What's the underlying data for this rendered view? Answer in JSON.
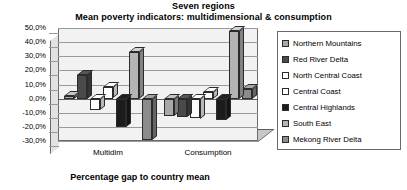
{
  "chart": {
    "title_line1": "Seven regions",
    "title_line2": "Mean poverty indicators: multidimensional & consumption",
    "axis_title": "Percentage gap to country mean"
  },
  "chart_data": {
    "type": "bar",
    "subtitle": "Mean poverty indicators: multidimensional & consumption",
    "xlabel": "Percentage gap to country mean",
    "ylabel": "",
    "categories": [
      "Multidim",
      "Consumption"
    ],
    "ylim": [
      -30,
      50
    ],
    "ytick_labels": [
      "50,0%",
      "40,0%",
      "30,0%",
      "20,0%",
      "10,0%",
      "0,0%",
      "-10,0%",
      "-20,0%",
      "-30,0%"
    ],
    "ytick_values": [
      50,
      40,
      30,
      20,
      10,
      0,
      -10,
      -20,
      -30
    ],
    "grid": true,
    "legend_position": "right",
    "three_d": true,
    "series": [
      {
        "name": "Northern Mountains",
        "color": "#a8a8a8",
        "values": [
          2,
          -12
        ]
      },
      {
        "name": "Red River Delta",
        "color": "#4a4a4a",
        "values": [
          17,
          -13
        ]
      },
      {
        "name": "North Central Coast",
        "color": "#ffffff",
        "values": [
          -8,
          -14
        ]
      },
      {
        "name": "Central Coast",
        "color": "#ffffff",
        "values": [
          8,
          5
        ]
      },
      {
        "name": "Central Highlands",
        "color": "#1c1c1c",
        "values": [
          -20,
          -15
        ]
      },
      {
        "name": "South East",
        "color": "#b4b4b4",
        "values": [
          33,
          48
        ]
      },
      {
        "name": "Mekong River Delta",
        "color": "#8c8c8c",
        "values": [
          -29,
          7
        ]
      }
    ]
  },
  "legend": {
    "items": [
      {
        "label": "Northern Mountains",
        "color": "#a8a8a8"
      },
      {
        "label": "Red River Delta",
        "color": "#4a4a4a"
      },
      {
        "label": "North Central Coast",
        "color": "#ffffff"
      },
      {
        "label": "Central Coast",
        "color": "#ffffff"
      },
      {
        "label": "Central Highlands",
        "color": "#1c1c1c"
      },
      {
        "label": "South East",
        "color": "#b4b4b4"
      },
      {
        "label": "Mekong River Delta",
        "color": "#8c8c8c"
      }
    ]
  }
}
